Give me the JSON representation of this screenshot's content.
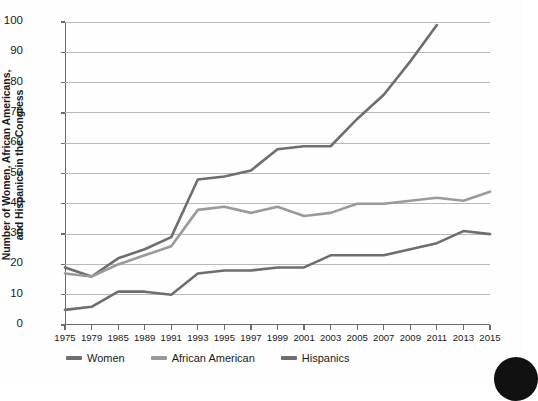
{
  "axis": {
    "y_title_line1": "Number of  Women, African Americans,",
    "y_title_line2": "and Hispanics in the Congress"
  },
  "legend": {
    "items": [
      {
        "label": "Women",
        "color": "#6e6e6e"
      },
      {
        "label": "African American",
        "color": "#9a9a9a"
      },
      {
        "label": "Hispanics",
        "color": "#6e6e6e"
      }
    ]
  },
  "chart_data": {
    "type": "line",
    "title": "",
    "xlabel": "",
    "ylabel": "Number of  Women, African Americans, and Hispanics in the Congress",
    "ylim": [
      0,
      100
    ],
    "yticks": [
      0,
      10,
      20,
      30,
      40,
      50,
      60,
      70,
      80,
      90,
      100
    ],
    "grid": true,
    "legend_position": "bottom",
    "categories": [
      "1975",
      "1979",
      "1985",
      "1989",
      "1991",
      "1993",
      "1995",
      "1997",
      "1999",
      "2001",
      "2003",
      "2005",
      "2007",
      "2009",
      "2011",
      "2013",
      "2015"
    ],
    "series": [
      {
        "name": "Women",
        "color": "#6e6e6e",
        "values": [
          19,
          16,
          22,
          25,
          29,
          48,
          49,
          51,
          58,
          59,
          59,
          68,
          76,
          87,
          99,
          null,
          null
        ]
      },
      {
        "name": "African American",
        "color": "#9a9a9a",
        "values": [
          17,
          16,
          20,
          23,
          26,
          38,
          39,
          37,
          39,
          36,
          37,
          40,
          40,
          41,
          42,
          41,
          44
        ]
      },
      {
        "name": "Hispanics",
        "color": "#6e6e6e",
        "values": [
          5,
          6,
          11,
          11,
          10,
          17,
          18,
          18,
          19,
          19,
          23,
          23,
          23,
          25,
          27,
          31,
          30
        ]
      }
    ]
  }
}
